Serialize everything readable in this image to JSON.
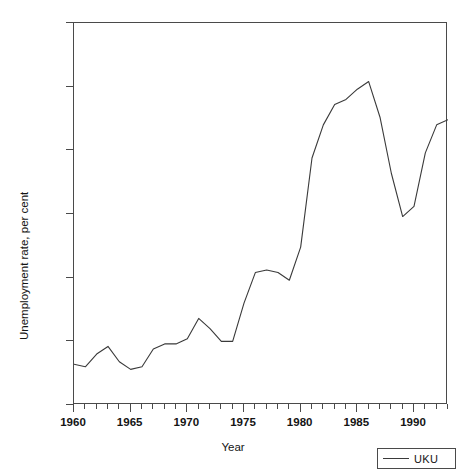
{
  "chart_data": {
    "type": "line",
    "title": "",
    "xlabel": "Year",
    "ylabel": "Unemployment rate, per cent",
    "xlim": [
      1960,
      1993
    ],
    "ylim": [
      0.0,
      15.0
    ],
    "grid": false,
    "legend_position": "bottom-right",
    "y_ticks": [
      "0.0",
      "2.5",
      "5.0",
      "7.5",
      "10.0",
      "12.5",
      "15.0"
    ],
    "y_tick_values": [
      0.0,
      2.5,
      5.0,
      7.5,
      10.0,
      12.5,
      15.0
    ],
    "x_ticks": [
      "1960",
      "1965",
      "1970",
      "1975",
      "1980",
      "1985",
      "1990"
    ],
    "x_tick_values": [
      1960,
      1965,
      1970,
      1975,
      1980,
      1985,
      1990
    ],
    "x_minor_tick_step": 1,
    "series": [
      {
        "name": "UKU",
        "color": "#3a3a3a",
        "x": [
          1960,
          1961,
          1962,
          1963,
          1964,
          1965,
          1966,
          1967,
          1968,
          1969,
          1970,
          1971,
          1972,
          1973,
          1974,
          1975,
          1976,
          1977,
          1978,
          1979,
          1980,
          1981,
          1982,
          1983,
          1984,
          1985,
          1986,
          1987,
          1988,
          1989,
          1990,
          1991,
          1992,
          1993
        ],
        "values": [
          1.6,
          1.5,
          2.0,
          2.3,
          1.7,
          1.4,
          1.5,
          2.2,
          2.4,
          2.4,
          2.6,
          3.4,
          3.0,
          2.5,
          2.5,
          4.0,
          5.2,
          5.3,
          5.2,
          4.9,
          6.2,
          9.7,
          11.0,
          11.8,
          12.0,
          12.4,
          12.7,
          11.3,
          9.1,
          7.4,
          7.8,
          9.9,
          11.0,
          11.2
        ]
      }
    ]
  },
  "legend": {
    "entries": [
      {
        "label": "UKU"
      }
    ]
  }
}
